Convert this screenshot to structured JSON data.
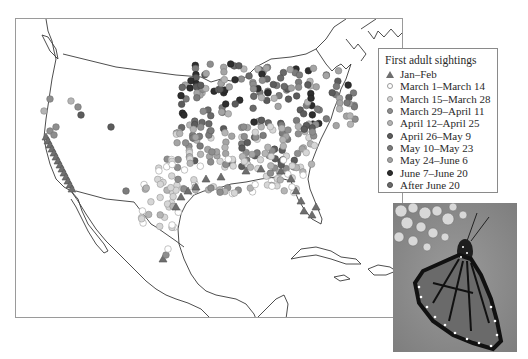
{
  "figure": {
    "legend": {
      "title": "First adult sightings",
      "items": [
        {
          "label": "Jan–Feb",
          "symbol": "triangle",
          "color": "#6e6e6e",
          "stroke": "#555555"
        },
        {
          "label": "March 1–March 14",
          "symbol": "circle",
          "color": "#ffffff",
          "stroke": "#9a9a9a"
        },
        {
          "label": "March 15–March 28",
          "symbol": "circle",
          "color": "#d6d6d6",
          "stroke": "#9a9a9a"
        },
        {
          "label": "March 29–April 11",
          "symbol": "circle",
          "color": "#8e8e8e",
          "stroke": "#707070"
        },
        {
          "label": "April 12–April 25",
          "symbol": "circle",
          "color": "#b4b4b4",
          "stroke": "#8a8a8a"
        },
        {
          "label": "April 26–May 9",
          "symbol": "circle",
          "color": "#5c5c5c",
          "stroke": "#444444"
        },
        {
          "label": "May 10–May 23",
          "symbol": "circle",
          "color": "#7c7c7c",
          "stroke": "#5e5e5e"
        },
        {
          "label": "May 24–June 6",
          "symbol": "circle",
          "color": "#a4a4a4",
          "stroke": "#7e7e7e"
        },
        {
          "label": "June 7–June 20",
          "symbol": "circle",
          "color": "#2e2e2e",
          "stroke": "#1e1e1e"
        },
        {
          "label": "After June 20",
          "symbol": "circle",
          "color": "#6a6a6a",
          "stroke": "#4e4e4e"
        }
      ]
    },
    "photo": {
      "description": "Monarch butterfly on milkweed flowers"
    }
  },
  "chart_data": {
    "type": "scatter",
    "title": "First adult sightings",
    "categories": [
      "Jan–Feb",
      "March 1–March 14",
      "March 15–March 28",
      "March 29–April 11",
      "April 12–April 25",
      "April 26–May 9",
      "May 10–May 23",
      "May 24–June 6",
      "June 7–June 20",
      "After June 20"
    ],
    "region": "North America (United States, southern Canada, Mexico, Caribbean)"
  }
}
